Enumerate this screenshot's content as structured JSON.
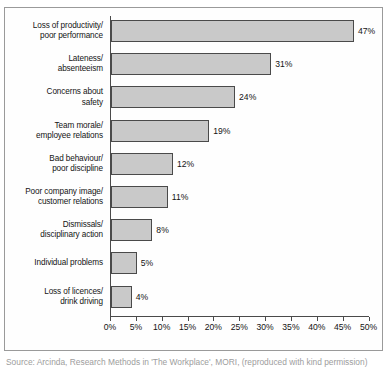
{
  "chart_data": {
    "type": "bar",
    "orientation": "horizontal",
    "title": "",
    "xlabel": "",
    "ylabel": "",
    "xlim": [
      0,
      50
    ],
    "xtick_labels": [
      "0%",
      "5%",
      "10%",
      "15%",
      "20%",
      "25%",
      "30%",
      "35%",
      "40%",
      "45%",
      "50%"
    ],
    "xtick_values": [
      0,
      5,
      10,
      15,
      20,
      25,
      30,
      35,
      40,
      45,
      50
    ],
    "grid": false,
    "legend": null,
    "bar_color": "#c9c9c9",
    "bar_border_color": "#4a4a4a",
    "categories": [
      "Loss of productivity/\npoor performance",
      "Lateness/\nabsenteeism",
      "Concerns about\nsafety",
      "Team morale/\nemployee relations",
      "Bad behaviour/\npoor discipline",
      "Poor company image/\ncustomer relations",
      "Dismissals/\ndisciplinary action",
      "Individual problems",
      "Loss of licences/\ndrink driving"
    ],
    "values": [
      47,
      31,
      24,
      19,
      12,
      11,
      8,
      5,
      4
    ],
    "value_labels": [
      "47%",
      "31%",
      "24%",
      "19%",
      "12%",
      "11%",
      "8%",
      "5%",
      "4%"
    ]
  },
  "caption": {
    "text": "Source: Arcinda, Research Methods in 'The Workplace', MORI, (reproduced with kind permission)"
  }
}
